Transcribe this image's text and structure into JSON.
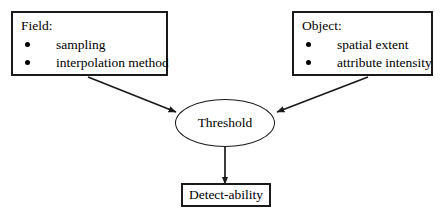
{
  "diagram": {
    "caption_fragment": "",
    "background_color": "#ffffff",
    "line_color": "#1a1a1a",
    "text_color": "#000000",
    "nodes": {
      "field": {
        "heading": "Field:",
        "bullets": [
          "sampling",
          "interpolation method"
        ]
      },
      "object": {
        "heading": "Object:",
        "bullets": [
          "spatial extent",
          "attribute intensity"
        ]
      },
      "threshold": {
        "label": "Threshold"
      },
      "detectability": {
        "label": "Detect-ability"
      }
    },
    "edges": [
      {
        "from": "field",
        "to": "threshold",
        "style": "solid-arrow"
      },
      {
        "from": "object",
        "to": "threshold",
        "style": "solid-arrow"
      },
      {
        "from": "threshold",
        "to": "detectability",
        "style": "solid-arrow"
      }
    ]
  }
}
